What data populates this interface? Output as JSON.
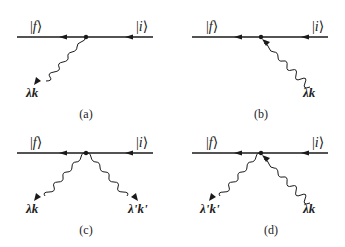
{
  "diagram": {
    "type": "feynman-diagrams",
    "colors": {
      "line": "#1a1a1a",
      "text": "#222222",
      "background": "#ffffff"
    },
    "panels": [
      {
        "id": "a",
        "caption": "(a)",
        "final_state": "f",
        "initial_state": "i",
        "photons": [
          {
            "label_lambda": "λ",
            "label_k": "k",
            "direction": "emitted",
            "side": "left"
          }
        ]
      },
      {
        "id": "b",
        "caption": "(b)",
        "final_state": "f",
        "initial_state": "i",
        "photons": [
          {
            "label_lambda": "λ",
            "label_k": "k",
            "direction": "absorbed",
            "side": "right"
          }
        ]
      },
      {
        "id": "c",
        "caption": "(c)",
        "final_state": "f",
        "initial_state": "i",
        "photons": [
          {
            "label_lambda": "λ",
            "label_k": "k",
            "direction": "emitted",
            "side": "left"
          },
          {
            "label_lambda": "λ'",
            "label_k": "k'",
            "direction": "emitted",
            "side": "right"
          }
        ]
      },
      {
        "id": "d",
        "caption": "(d)",
        "final_state": "f",
        "initial_state": "i",
        "photons": [
          {
            "label_lambda": "λ'",
            "label_k": "k'",
            "direction": "emitted",
            "side": "left"
          },
          {
            "label_lambda": "λ",
            "label_k": "k",
            "direction": "absorbed",
            "side": "right"
          }
        ]
      }
    ]
  }
}
